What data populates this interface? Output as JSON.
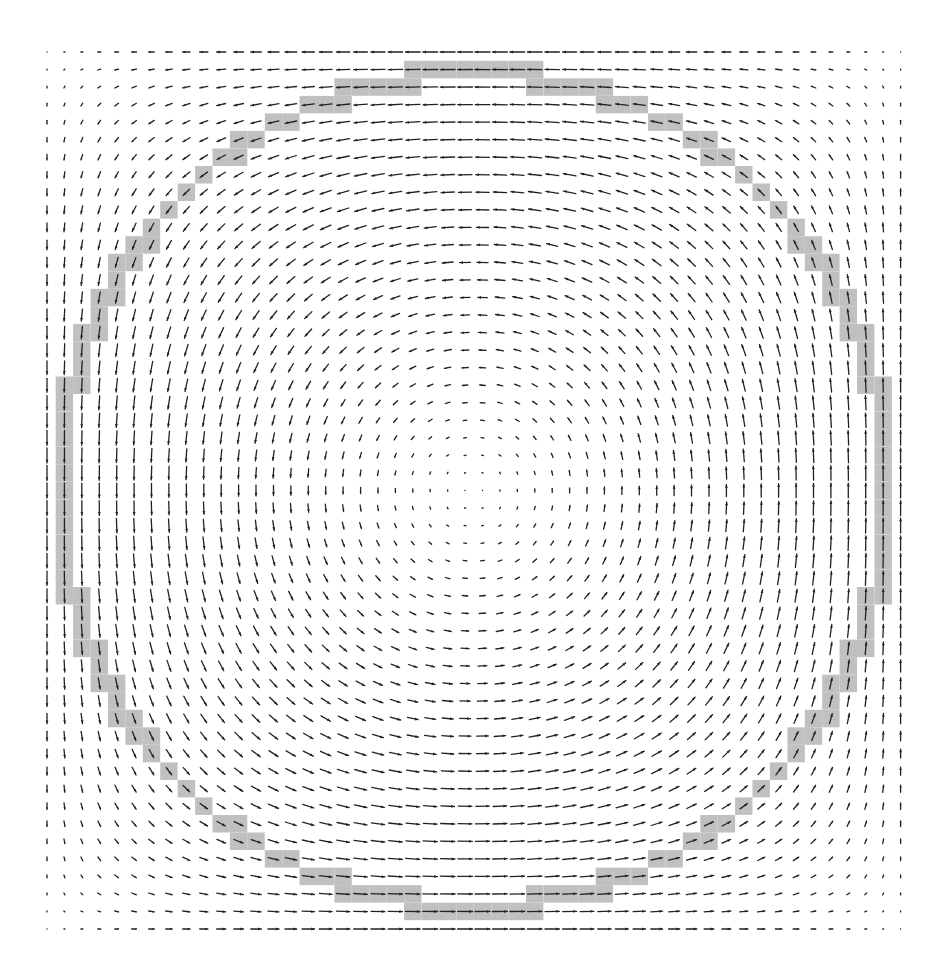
{
  "figure": {
    "type": "vector-field-quiver",
    "background": "#ffffff",
    "arrow_color": "#222222",
    "highlight_color": "#c0c0c0",
    "grid": {
      "cols": 50,
      "rows": 51,
      "x0": 47,
      "y0": 52,
      "dx": 17.42,
      "dy": 17.54
    },
    "circle": {
      "center_col": 24.5,
      "center_row": 25.0,
      "radius_cells": 23.75,
      "band_half_width": 0.55
    },
    "field": {
      "rotation": "counterclockwise-on-screen",
      "description": "Swirling vector field inside a square box; vectors vanish at the center and at corners, largest near the boundary midpoints. Grid cells lying on a discretized circle are shaded gray.",
      "max_arrow_len_px": 15
    }
  }
}
